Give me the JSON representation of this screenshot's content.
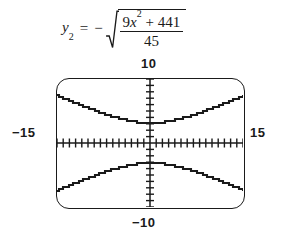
{
  "equation": {
    "lhs_var": "y",
    "lhs_subscript": "2",
    "equals": "=",
    "sign": "−",
    "numerator_coeff": "9",
    "numerator_var": "x",
    "numerator_exponent": "2",
    "numerator_plus": "+",
    "numerator_const": "441",
    "denominator": "45",
    "full_text": "y₂ = −√((9x² + 441)/45)"
  },
  "calculator": {
    "window": {
      "ymax_label": "10",
      "ymin_label": "−10",
      "xmin_label": "−15",
      "xmax_label": "15"
    }
  },
  "chart_data": {
    "type": "line",
    "title": "",
    "xlabel": "",
    "ylabel": "",
    "xlim": [
      -15,
      15
    ],
    "ylim": [
      -10,
      10
    ],
    "xtick_interval": 1,
    "ytick_interval": 1,
    "grid": false,
    "legend": "none",
    "axes_style": "tick-marked crosshair axes on graphing-calculator screen",
    "series": [
      {
        "name": "y1 = +sqrt((9x^2+441)/45)",
        "x": [
          -15,
          -13.5,
          -12,
          -10.5,
          -9,
          -7.5,
          -6,
          -4.5,
          -3,
          -1.5,
          0,
          1.5,
          3,
          4.5,
          6,
          7.5,
          9,
          10.5,
          12,
          13.5,
          15
        ],
        "values": [
          6.95,
          6.33,
          5.72,
          5.12,
          4.54,
          3.99,
          3.49,
          3.06,
          2.74,
          2.55,
          2.49,
          2.55,
          2.74,
          3.06,
          3.49,
          3.99,
          4.54,
          5.12,
          5.72,
          6.33,
          6.95
        ]
      },
      {
        "name": "y2 = -sqrt((9x^2+441)/45)",
        "x": [
          -15,
          -13.5,
          -12,
          -10.5,
          -9,
          -7.5,
          -6,
          -4.5,
          -3,
          -1.5,
          0,
          1.5,
          3,
          4.5,
          6,
          7.5,
          9,
          10.5,
          12,
          13.5,
          15
        ],
        "values": [
          -6.95,
          -6.33,
          -5.72,
          -5.12,
          -4.54,
          -3.99,
          -3.49,
          -3.06,
          -2.74,
          -2.55,
          -2.49,
          -2.55,
          -2.74,
          -3.06,
          -3.49,
          -3.99,
          -4.54,
          -5.12,
          -5.72,
          -6.33,
          -6.95
        ]
      }
    ],
    "annotations": [
      {
        "text": "10",
        "position": "top-center, above screen"
      },
      {
        "text": "−10",
        "position": "bottom-center, below screen"
      },
      {
        "text": "−15",
        "position": "left-middle, outside screen"
      },
      {
        "text": "15",
        "position": "right-middle, outside screen"
      }
    ]
  },
  "colors": {
    "ink": "#1a1a1a",
    "background": "#ffffff"
  }
}
